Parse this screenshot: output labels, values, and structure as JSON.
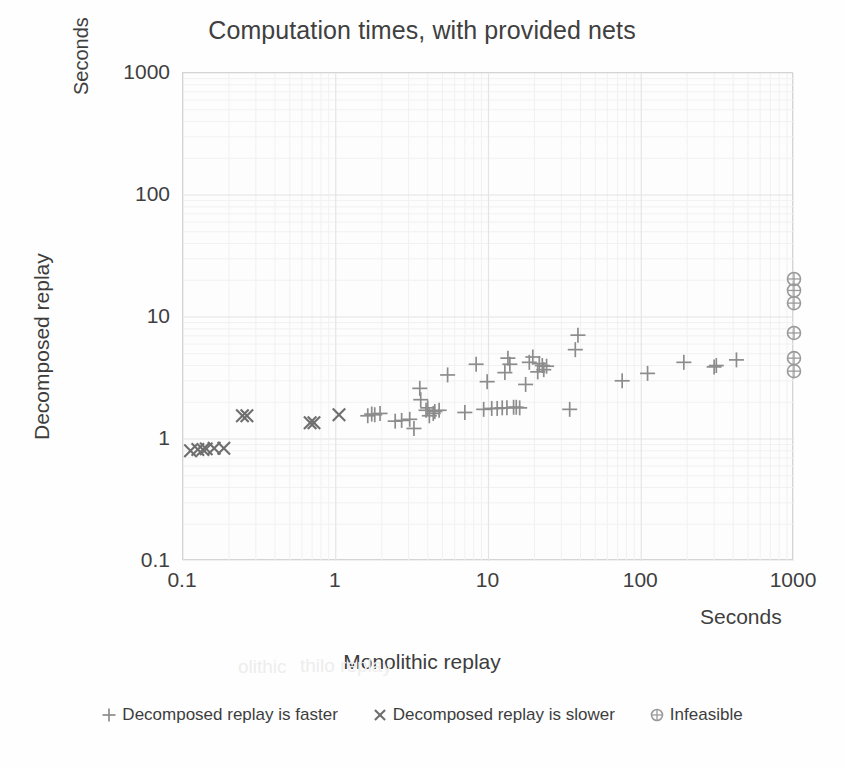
{
  "chart_data": {
    "type": "scatter",
    "title": "Computation times, with provided nets",
    "xlabel": "Monolithic replay",
    "ylabel": "Decomposed replay",
    "x_unit_label": "Seconds",
    "y_unit_label": "Seconds",
    "xscale": "log",
    "yscale": "log",
    "xlim": [
      0.1,
      1000
    ],
    "ylim": [
      0.1,
      1000
    ],
    "xticks": [
      "0.1",
      "1",
      "10",
      "100",
      "1000"
    ],
    "yticks": [
      "1000",
      "100",
      "10",
      "1",
      "0.1"
    ],
    "grid": true,
    "legend_position": "bottom",
    "series": [
      {
        "name": "Decomposed replay is faster",
        "marker": "plus",
        "color": "#8c8c8c",
        "points": [
          [
            1.62,
            1.55
          ],
          [
            1.72,
            1.6
          ],
          [
            1.8,
            1.58
          ],
          [
            1.95,
            1.62
          ],
          [
            2.45,
            1.4
          ],
          [
            2.7,
            1.42
          ],
          [
            3.05,
            1.45
          ],
          [
            3.25,
            1.22
          ],
          [
            3.55,
            2.6
          ],
          [
            3.6,
            2.1
          ],
          [
            3.9,
            1.72
          ],
          [
            4.0,
            1.8
          ],
          [
            4.1,
            1.55
          ],
          [
            4.35,
            1.62
          ],
          [
            4.45,
            1.68
          ],
          [
            4.75,
            1.72
          ],
          [
            5.4,
            3.35
          ],
          [
            7.0,
            1.65
          ],
          [
            8.3,
            4.1
          ],
          [
            9.3,
            1.75
          ],
          [
            9.8,
            2.95
          ],
          [
            10.5,
            1.78
          ],
          [
            11.4,
            1.78
          ],
          [
            12.3,
            1.8
          ],
          [
            12.8,
            3.5
          ],
          [
            13.2,
            1.8
          ],
          [
            13.4,
            4.6
          ],
          [
            13.8,
            4.1
          ],
          [
            14.6,
            1.82
          ],
          [
            15.2,
            1.82
          ],
          [
            16.0,
            1.8
          ],
          [
            17.5,
            2.8
          ],
          [
            18.5,
            4.25
          ],
          [
            19.5,
            4.7
          ],
          [
            21.0,
            3.55
          ],
          [
            21.5,
            4.15
          ],
          [
            22.5,
            4.0
          ],
          [
            23.0,
            3.7
          ],
          [
            24.0,
            3.95
          ],
          [
            34.0,
            1.75
          ],
          [
            37.0,
            5.4
          ],
          [
            38.5,
            7.1
          ],
          [
            75.0,
            3.0
          ],
          [
            110.0,
            3.45
          ],
          [
            190.0,
            4.25
          ],
          [
            300.0,
            3.9
          ],
          [
            310.0,
            4.0
          ],
          [
            420.0,
            4.45
          ]
        ]
      },
      {
        "name": "Decomposed replay is slower",
        "marker": "cross",
        "color": "#6e6e6e",
        "points": [
          [
            0.112,
            0.8
          ],
          [
            0.125,
            0.82
          ],
          [
            0.135,
            0.82
          ],
          [
            0.142,
            0.83
          ],
          [
            0.16,
            0.84
          ],
          [
            0.185,
            0.84
          ],
          [
            0.245,
            1.55
          ],
          [
            0.262,
            1.55
          ],
          [
            0.68,
            1.36
          ],
          [
            0.72,
            1.36
          ],
          [
            1.05,
            1.58
          ]
        ]
      },
      {
        "name": "Infeasible",
        "marker": "circle-plus",
        "color": "#9a9a9a",
        "points": [
          [
            1000,
            20.5
          ],
          [
            1000,
            16.5
          ],
          [
            1000,
            13.0
          ],
          [
            1000,
            7.4
          ],
          [
            1000,
            4.6
          ],
          [
            1000,
            3.6
          ]
        ]
      }
    ]
  },
  "legend": {
    "items": [
      {
        "label": "Decomposed replay is faster",
        "glyph": "plus-marker-icon"
      },
      {
        "label": "Decomposed replay is slower",
        "glyph": "cross-marker-icon"
      },
      {
        "label": "Infeasible",
        "glyph": "circle-marker-icon"
      }
    ]
  },
  "colors": {
    "background": "#fefefe",
    "plot_background": "#fdfdfd",
    "axis_line": "#d4d4d4",
    "major_gridline": "#e4e4e4",
    "minor_gridline": "#f1f1f1",
    "text": "#3d3d3d",
    "marker_faster": "#8c8c8c",
    "marker_slower": "#6e6e6e",
    "marker_infeasible": "#9a9a9a"
  },
  "ghost_text": [
    {
      "text": "thilo replay",
      "x": 300,
      "y": 655
    },
    {
      "text": "olithic",
      "x": 238,
      "y": 656
    }
  ]
}
